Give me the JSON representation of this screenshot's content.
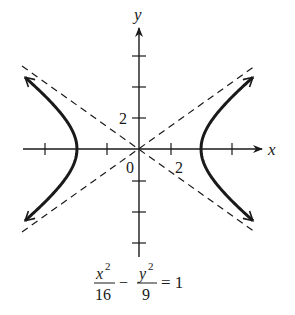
{
  "figure": {
    "type": "hyperbola-graph",
    "equation": {
      "term1": {
        "numerator": "x",
        "num_exponent": "2",
        "denominator": "16"
      },
      "operator": "−",
      "term2": {
        "numerator": "y",
        "num_exponent": "2",
        "denominator": "9"
      },
      "equals": "= 1"
    },
    "axes": {
      "x_label": "x",
      "y_label": "y",
      "origin_label": "0",
      "x_tick_label": "2",
      "y_tick_label": "2",
      "tick_spacing_units": 2
    },
    "curve": {
      "a": 4,
      "b": 3,
      "vertices": [
        [
          -4,
          0
        ],
        [
          4,
          0
        ]
      ],
      "asymptotes": [
        "y = 3x/4",
        "y = -3x/4"
      ]
    },
    "colors": {
      "ink": "#1a1a1a",
      "background": "#ffffff"
    }
  }
}
